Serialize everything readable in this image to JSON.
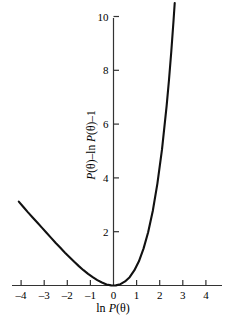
{
  "figure": {
    "background_color": "#ffffff",
    "curve_color": "#111111",
    "axis_color": "#333333"
  },
  "axes": {
    "x_title_parts": {
      "op": "ln",
      "var": "P",
      "arg": "(θ)"
    },
    "x_title_plain": "ln P(θ)",
    "y_title_parts": {
      "var1": "P",
      "arg1": "(θ)",
      "minus1": "–",
      "op": "ln",
      "var2": "P",
      "arg2": "(θ)",
      "minus2": "–",
      "one": "1"
    },
    "y_title_plain": "P(θ)–ln P(θ)–1",
    "x_ticks": [
      {
        "value": -4,
        "label": "–4"
      },
      {
        "value": -3,
        "label": "–3"
      },
      {
        "value": -2,
        "label": "–2"
      },
      {
        "value": -1,
        "label": "–1"
      },
      {
        "value": 0,
        "label": "0"
      },
      {
        "value": 1,
        "label": "1"
      },
      {
        "value": 2,
        "label": "2"
      },
      {
        "value": 3,
        "label": "3"
      },
      {
        "value": 4,
        "label": "4"
      }
    ],
    "y_ticks": [
      {
        "value": 2,
        "label": "2"
      },
      {
        "value": 4,
        "label": "4"
      },
      {
        "value": 6,
        "label": "6"
      },
      {
        "value": 8,
        "label": "8"
      },
      {
        "value": 10,
        "label": "10"
      }
    ]
  },
  "chart_data": {
    "type": "line",
    "title": "",
    "subtitle": "",
    "xlabel": "ln P(θ)",
    "ylabel": "P(θ)–ln P(θ)–1",
    "xlim": [
      -4.4,
      4.4
    ],
    "ylim": [
      0,
      10.6
    ],
    "xticks": [
      -4,
      -3,
      -2,
      -1,
      0,
      1,
      2,
      3,
      4
    ],
    "yticks": [
      2,
      4,
      6,
      8,
      10
    ],
    "grid": false,
    "legend": null,
    "annotations": [],
    "function": "y = exp(x) - x - 1",
    "series": [
      {
        "name": "P(θ)–ln P(θ)–1",
        "color": "#111111",
        "x": [
          -4.1,
          -3.9,
          -3.7,
          -3.5,
          -3.3,
          -3.1,
          -2.9,
          -2.7,
          -2.5,
          -2.3,
          -2.1,
          -1.9,
          -1.7,
          -1.5,
          -1.3,
          -1.1,
          -0.9,
          -0.7,
          -0.5,
          -0.3,
          -0.1,
          0.0,
          0.1,
          0.3,
          0.5,
          0.7,
          0.9,
          1.1,
          1.3,
          1.5,
          1.7,
          1.9,
          2.1,
          2.3,
          2.4,
          2.5,
          2.6,
          2.65
        ],
        "y": [
          3.12,
          2.92,
          2.72,
          2.53,
          2.34,
          2.15,
          1.96,
          1.77,
          1.58,
          1.4,
          1.22,
          1.05,
          0.88,
          0.72,
          0.57,
          0.43,
          0.31,
          0.2,
          0.11,
          0.04,
          0.005,
          0.0,
          0.005,
          0.05,
          0.15,
          0.31,
          0.56,
          0.9,
          1.37,
          1.98,
          2.77,
          3.79,
          5.06,
          6.68,
          7.62,
          8.68,
          9.86,
          10.5
        ]
      }
    ]
  }
}
